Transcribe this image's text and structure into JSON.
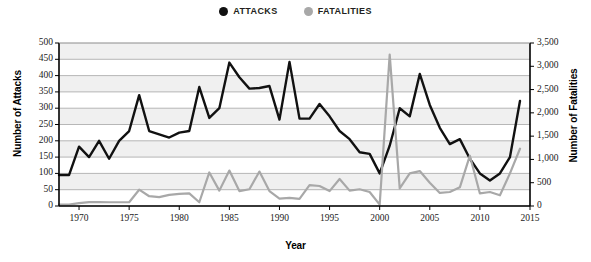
{
  "legend": {
    "position": "top-center",
    "items": [
      {
        "label": "ATTACKS",
        "color": "#111111",
        "marker": "circle"
      },
      {
        "label": "FATALITIES",
        "color": "#a8a8a8",
        "marker": "circle"
      }
    ]
  },
  "axes": {
    "x_title": "Year",
    "y_left_title": "Number of Attacks",
    "y_right_title": "Number of Fatalities"
  },
  "chart_data": {
    "type": "line",
    "title": "",
    "subtitle": "",
    "xlabel": "Year",
    "ylabel": "Number of Attacks",
    "y2label": "Number of Fatalities",
    "xlim": [
      1968,
      2015
    ],
    "ylim": [
      0,
      500
    ],
    "y2lim": [
      0,
      3500
    ],
    "grid": true,
    "legend_position": "top-center",
    "x_ticks": [
      1970,
      1975,
      1980,
      1985,
      1990,
      1995,
      2000,
      2005,
      2010,
      2015
    ],
    "x_tick_labels": [
      "1970",
      "1975",
      "1980",
      "1985",
      "1990",
      "1995",
      "2000",
      "2005",
      "2010",
      "2015"
    ],
    "y_ticks": [
      0,
      50,
      100,
      150,
      200,
      250,
      300,
      350,
      400,
      450,
      500
    ],
    "y_tick_labels": [
      "0",
      "50",
      "100",
      "150",
      "200",
      "250",
      "300",
      "350",
      "400",
      "450",
      "500"
    ],
    "y2_ticks": [
      0,
      500,
      1000,
      1500,
      2000,
      2500,
      3000,
      3500
    ],
    "y2_tick_labels": [
      "0",
      "500",
      "1,000",
      "1,500",
      "2,000",
      "2,500",
      "3,000",
      "3,500"
    ],
    "x": [
      1968,
      1969,
      1970,
      1971,
      1972,
      1973,
      1974,
      1975,
      1976,
      1977,
      1978,
      1979,
      1980,
      1981,
      1982,
      1983,
      1984,
      1985,
      1986,
      1987,
      1988,
      1989,
      1990,
      1991,
      1992,
      1993,
      1994,
      1995,
      1996,
      1997,
      1998,
      1999,
      2000,
      2001,
      2002,
      2003,
      2004,
      2005,
      2006,
      2007,
      2008,
      2009,
      2010,
      2011,
      2012,
      2013,
      2014
    ],
    "series": [
      {
        "name": "ATTACKS",
        "axis": "left",
        "color": "#111111",
        "values": [
          95,
          95,
          182,
          150,
          200,
          145,
          200,
          230,
          340,
          230,
          220,
          210,
          225,
          230,
          365,
          270,
          300,
          440,
          395,
          360,
          362,
          368,
          265,
          442,
          268,
          268,
          313,
          275,
          230,
          205,
          165,
          160,
          100,
          185,
          300,
          275,
          405,
          310,
          240,
          190,
          205,
          145,
          100,
          78,
          100,
          150,
          322
        ]
      },
      {
        "name": "FATALITIES",
        "axis": "right",
        "color": "#a8a8a8",
        "values": [
          30,
          30,
          60,
          85,
          85,
          80,
          80,
          80,
          350,
          210,
          190,
          240,
          260,
          270,
          80,
          720,
          330,
          760,
          320,
          360,
          740,
          320,
          160,
          175,
          155,
          450,
          430,
          320,
          580,
          330,
          360,
          300,
          30,
          3250,
          380,
          700,
          750,
          500,
          280,
          300,
          400,
          1080,
          270,
          300,
          230,
          700,
          1230
        ]
      }
    ],
    "annotations": [
      {
        "text": "2001 fatalities spike",
        "x": 2001,
        "y2": 3250
      }
    ]
  },
  "colors": {
    "attacks": "#111111",
    "fatalities": "#a8a8a8",
    "band": "#f0f0f0",
    "gridline": "#9b9b9b",
    "axis": "#000000",
    "background": "#ffffff"
  }
}
